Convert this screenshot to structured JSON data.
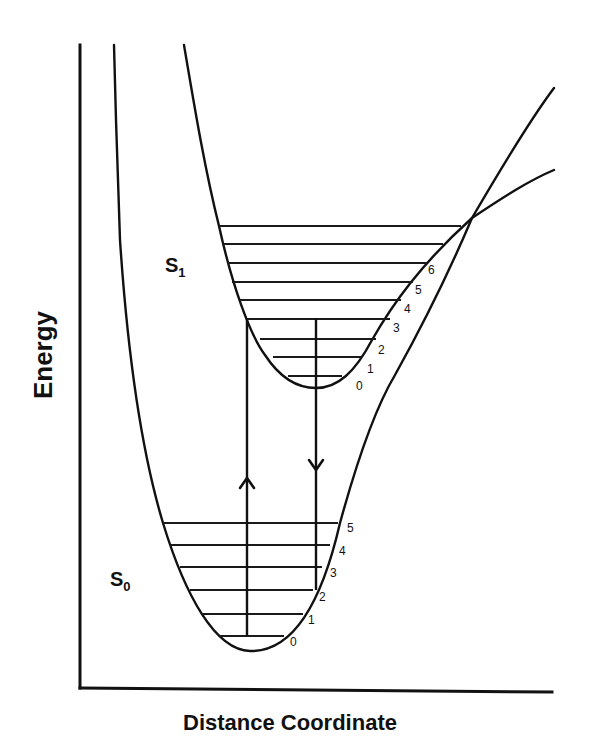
{
  "title": "",
  "axes": {
    "x_label": "Distance Coordinate",
    "y_label": "Energy"
  },
  "states": {
    "S0": {
      "label": "S",
      "subscript": "0",
      "label_pos": [
        110,
        586
      ],
      "curve_path": "M114,45 L116,120 L120,240 C126,330 138,440 163,523 C185,595 215,650 250,651 C290,652 320,610 340,523 C360,450 380,400 395,375 C420,330 450,270 472,218 C500,170 530,120 554,88",
      "levels": [
        {
          "v": "0",
          "y": 636,
          "x1": 220,
          "x2": 284,
          "lx": 290,
          "ly": 646
        },
        {
          "v": "1",
          "y": 614,
          "x1": 203,
          "x2": 303,
          "lx": 308,
          "ly": 624
        },
        {
          "v": "2",
          "y": 590,
          "x1": 190,
          "x2": 313,
          "lx": 319,
          "ly": 601
        },
        {
          "v": "3",
          "y": 567,
          "x1": 180,
          "x2": 322,
          "lx": 330,
          "ly": 577
        },
        {
          "v": "4",
          "y": 545,
          "x1": 170,
          "x2": 330,
          "lx": 339,
          "ly": 555
        },
        {
          "v": "5",
          "y": 523,
          "x1": 163,
          "x2": 338,
          "lx": 347,
          "ly": 532
        }
      ]
    },
    "S1": {
      "label": "S",
      "subscript": "1",
      "label_pos": [
        165,
        272
      ],
      "curve_path": "M184,45 C195,110 205,170 219,226 C232,285 250,335 265,355 C280,378 298,388 316,388 C338,388 355,372 372,340 C392,305 420,265 472,218 C505,196 530,180 554,170",
      "levels": [
        {
          "v": "0",
          "y": 376,
          "x1": 288,
          "x2": 342,
          "lx": 356,
          "ly": 390
        },
        {
          "v": "1",
          "y": 357,
          "x1": 273,
          "x2": 362,
          "lx": 367,
          "ly": 373
        },
        {
          "v": "2",
          "y": 339,
          "x1": 260,
          "x2": 376,
          "lx": 378,
          "ly": 354
        },
        {
          "v": "3",
          "y": 319,
          "x1": 248,
          "x2": 390,
          "lx": 393,
          "ly": 332
        },
        {
          "v": "4",
          "y": 300,
          "x1": 240,
          "x2": 401,
          "lx": 404,
          "ly": 313
        },
        {
          "v": "5",
          "y": 282,
          "x1": 232,
          "x2": 413,
          "lx": 415,
          "ly": 294
        },
        {
          "v": "6",
          "y": 263,
          "x1": 227,
          "x2": 427,
          "lx": 428,
          "ly": 274
        },
        {
          "v": "",
          "y": 244,
          "x1": 222,
          "x2": 443,
          "lx": 0,
          "ly": 0
        },
        {
          "v": "",
          "y": 226,
          "x1": 219,
          "x2": 461,
          "lx": 0,
          "ly": 0
        }
      ]
    }
  },
  "transitions": [
    {
      "name": "absorption",
      "direction": "up",
      "x": 247,
      "y_from": 636,
      "y_to": 318,
      "arrow_y": 478
    },
    {
      "name": "emission",
      "direction": "down",
      "x": 316,
      "y_from": 318,
      "y_to": 590,
      "arrow_y": 470
    }
  ],
  "crossing_point": [
    472,
    218
  ]
}
